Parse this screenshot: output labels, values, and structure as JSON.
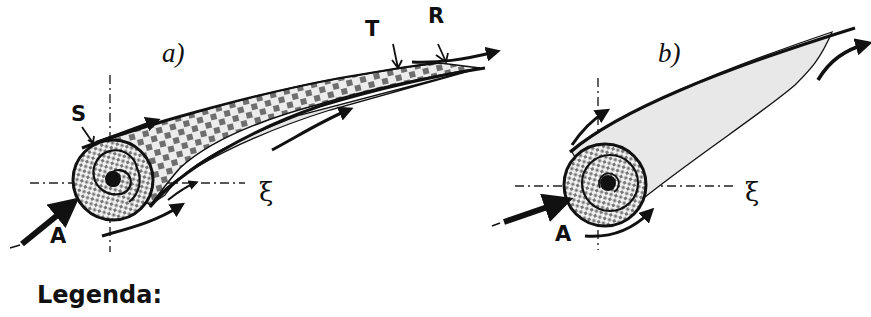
{
  "figure": {
    "panels": [
      {
        "id": "a",
        "label": "a)",
        "points": {
          "S": "S",
          "T": "T",
          "R": "R",
          "A": "A"
        },
        "axis_label": "ξ"
      },
      {
        "id": "b",
        "label": "b)",
        "points": {
          "A": "A"
        },
        "axis_label": "ξ"
      }
    ],
    "legend_title": "Legenda:"
  },
  "colors": {
    "ink": "#111111",
    "fill_light": "#e9e9e9",
    "checker": "#6e6e6e",
    "background": "#ffffff"
  }
}
